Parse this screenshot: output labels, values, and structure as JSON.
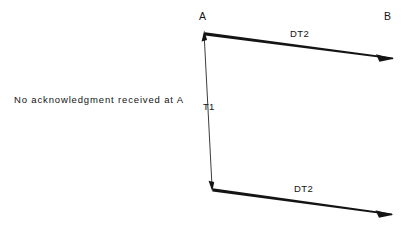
{
  "diagram": {
    "type": "sequence-diagram",
    "background_color": "#ffffff",
    "line_color": "#141414",
    "nodes": [
      {
        "id": "A",
        "label": "A",
        "x": 204,
        "lifeline": true
      },
      {
        "id": "B",
        "label": "B",
        "x": 390,
        "lifeline": false
      }
    ],
    "messages": [
      {
        "id": "dt2-top",
        "label": "DT2",
        "from": "A",
        "to": "B",
        "x1": 205,
        "y1": 34,
        "x2": 393,
        "y2": 59,
        "direction": "right",
        "arrowhead": "end"
      },
      {
        "id": "dt2-bottom",
        "label": "DT2",
        "from": "A",
        "to": "B",
        "x1": 213,
        "y1": 190,
        "x2": 392,
        "y2": 215,
        "direction": "right",
        "arrowhead": "end"
      }
    ],
    "timer": {
      "id": "T1",
      "label": "T1",
      "x1": 204,
      "y1": 34,
      "x2": 212,
      "y2": 188,
      "arrowhead": "both"
    },
    "annotation": {
      "id": "no-ack",
      "text": "No acknowledgment received at A"
    }
  }
}
